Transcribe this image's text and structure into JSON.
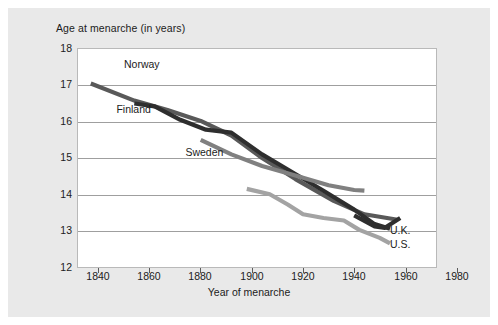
{
  "chart_data": {
    "type": "line",
    "title": "Age at menarche (in years)",
    "xlabel": "Year of menarche",
    "ylabel": "Age at menarche (in years)",
    "xlim": [
      1840,
      1980
    ],
    "ylim": [
      12,
      18
    ],
    "xticks": [
      1840,
      1860,
      1880,
      1900,
      1920,
      1940,
      1960,
      1980
    ],
    "yticks": [
      12,
      13,
      14,
      15,
      16,
      17,
      18
    ],
    "grid": "horizontal",
    "legend": "inline-labels",
    "series": [
      {
        "name": "Norway",
        "color": "#595959",
        "label_x": 1858,
        "label_y": 17.55,
        "points": [
          [
            1845,
            17.05
          ],
          [
            1862,
            16.58
          ],
          [
            1875,
            16.32
          ],
          [
            1888,
            16.02
          ],
          [
            1900,
            15.62
          ],
          [
            1912,
            15.0
          ],
          [
            1925,
            14.42
          ],
          [
            1940,
            13.82
          ],
          [
            1952,
            13.45
          ],
          [
            1965,
            13.3
          ]
        ]
      },
      {
        "name": "Finland",
        "color": "#2e2e2e",
        "label_x": 1855,
        "label_y": 16.32,
        "points": [
          [
            1862,
            16.5
          ],
          [
            1870,
            16.42
          ],
          [
            1880,
            16.05
          ],
          [
            1890,
            15.78
          ],
          [
            1900,
            15.7
          ],
          [
            1912,
            15.1
          ],
          [
            1924,
            14.6
          ],
          [
            1936,
            14.1
          ],
          [
            1948,
            13.58
          ],
          [
            1956,
            13.18
          ],
          [
            1962,
            13.05
          ]
        ]
      },
      {
        "name": "Sweden",
        "color": "#808080",
        "label_x": 1882,
        "label_y": 15.15,
        "points": [
          [
            1888,
            15.5
          ],
          [
            1900,
            15.1
          ],
          [
            1912,
            14.78
          ],
          [
            1925,
            14.52
          ],
          [
            1938,
            14.25
          ],
          [
            1948,
            14.12
          ],
          [
            1952,
            14.1
          ]
        ]
      },
      {
        "name": "U.K.",
        "color": "#2e2e2e",
        "label_x": 1962,
        "label_y": 12.98,
        "points": [
          [
            1948,
            13.42
          ],
          [
            1956,
            13.12
          ],
          [
            1960,
            13.08
          ],
          [
            1966,
            13.35
          ]
        ]
      },
      {
        "name": "U.S.",
        "color": "#a3a3a3",
        "label_x": 1962,
        "label_y": 12.6,
        "points": [
          [
            1906,
            14.15
          ],
          [
            1915,
            14.0
          ],
          [
            1922,
            13.72
          ],
          [
            1928,
            13.45
          ],
          [
            1936,
            13.35
          ],
          [
            1944,
            13.28
          ],
          [
            1950,
            13.02
          ],
          [
            1958,
            12.8
          ],
          [
            1962,
            12.65
          ]
        ]
      }
    ]
  },
  "axis": {
    "y_labels": [
      "18",
      "17",
      "16",
      "15",
      "14",
      "13",
      "12"
    ],
    "x_labels": [
      "1840",
      "1860",
      "1880",
      "1900",
      "1920",
      "1940",
      "1960",
      "1980"
    ]
  }
}
